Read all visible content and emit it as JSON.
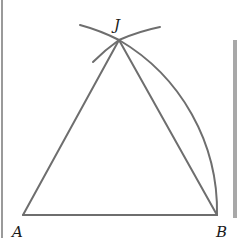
{
  "figure": {
    "type": "geometric-construction",
    "points": {
      "A": {
        "label": "A",
        "x": 23,
        "y": 215,
        "label_x": 13,
        "label_y": 236
      },
      "B": {
        "label": "B",
        "x": 217,
        "y": 215,
        "label_x": 216,
        "label_y": 236
      },
      "J": {
        "label": "J",
        "x": 119,
        "y": 40,
        "label_x": 114,
        "label_y": 30
      }
    },
    "segments": [
      {
        "from": "A",
        "to": "B"
      },
      {
        "from": "A",
        "to": "J"
      },
      {
        "from": "B",
        "to": "J"
      }
    ],
    "arcs": [
      {
        "center": "A",
        "from": "B",
        "to": "J",
        "description": "arc centered at A through B up to J"
      },
      {
        "center": "B",
        "description": "short arc centered at B crossing at J"
      },
      {
        "center": "A",
        "description": "short arc extension past J"
      }
    ],
    "colors": {
      "line": "#6e6e6e",
      "label": "#1a1a1a",
      "border": "#9a9a9a"
    }
  }
}
